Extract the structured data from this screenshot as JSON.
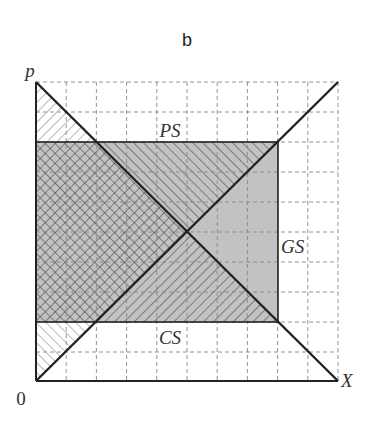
{
  "title": "b",
  "axes": {
    "y_label": "p",
    "x_label": "X",
    "origin_label": "0"
  },
  "regions": {
    "ps_label": "PS",
    "cs_label": "CS",
    "gs_label": "GS"
  },
  "grid": {
    "cells_x": 10,
    "cells_y": 10,
    "style": "dashed"
  },
  "curves": [
    {
      "name": "demand",
      "from": [
        0,
        10
      ],
      "to": [
        10,
        0
      ]
    },
    {
      "name": "supply",
      "from": [
        0,
        0
      ],
      "to": [
        10,
        10
      ]
    }
  ],
  "rectangle": {
    "x_from": 0,
    "x_to": 8,
    "y_from": 2,
    "y_to": 8
  },
  "colors": {
    "fill_gray": "#c2c2c2",
    "line": "#222222",
    "grid": "#888888",
    "hatch": "#333333"
  }
}
